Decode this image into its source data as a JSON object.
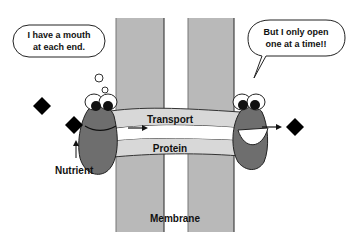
{
  "bubbles": {
    "left_line1": "I have a mouth",
    "left_line2": "at each end.",
    "right_line1": "But I only open",
    "right_line2": "one at a time!!"
  },
  "labels": {
    "nutrient": "Nutrient",
    "membrane": "Membrane",
    "transport": "Transport",
    "protein": "Protein"
  },
  "colors": {
    "membrane": "#b8b8b8",
    "protein_body": "#6e6e6e",
    "tube": "#d9d9d9",
    "nutrient": "#000000"
  }
}
